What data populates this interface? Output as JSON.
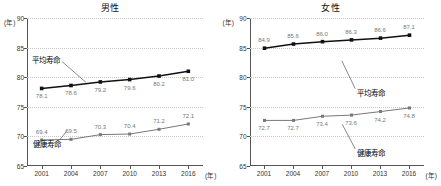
{
  "chart_data": [
    {
      "type": "line",
      "title": "男性",
      "xlabel": "(年)",
      "ylabel": "(年)",
      "categories": [
        "2001",
        "2004",
        "2007",
        "2010",
        "2013",
        "2016"
      ],
      "ylim": [
        65,
        90
      ],
      "yticks": [
        65,
        70,
        75,
        80,
        85,
        90
      ],
      "grid": true,
      "legend_position": "inline-annotation",
      "series": [
        {
          "name": "平均寿命",
          "values": [
            78.1,
            78.6,
            79.2,
            79.6,
            80.2,
            81.0
          ],
          "color": "#111111",
          "label_side": "below"
        },
        {
          "name": "健康寿命",
          "values": [
            69.4,
            69.5,
            70.3,
            70.4,
            71.2,
            72.1
          ],
          "color": "#777777",
          "label_side": "above"
        }
      ]
    },
    {
      "type": "line",
      "title": "女性",
      "xlabel": "(年)",
      "ylabel": "(年)",
      "categories": [
        "2001",
        "2004",
        "2007",
        "2010",
        "2013",
        "2016"
      ],
      "ylim": [
        65,
        90
      ],
      "yticks": [
        65,
        70,
        75,
        80,
        85,
        90
      ],
      "grid": true,
      "legend_position": "inline-annotation",
      "series": [
        {
          "name": "平均寿命",
          "values": [
            84.9,
            85.6,
            86.0,
            86.3,
            86.6,
            87.1
          ],
          "color": "#111111",
          "label_side": "above"
        },
        {
          "name": "健康寿命",
          "values": [
            72.7,
            72.7,
            73.4,
            73.6,
            74.2,
            74.8
          ],
          "color": "#777777",
          "label_side": "below"
        }
      ]
    }
  ]
}
